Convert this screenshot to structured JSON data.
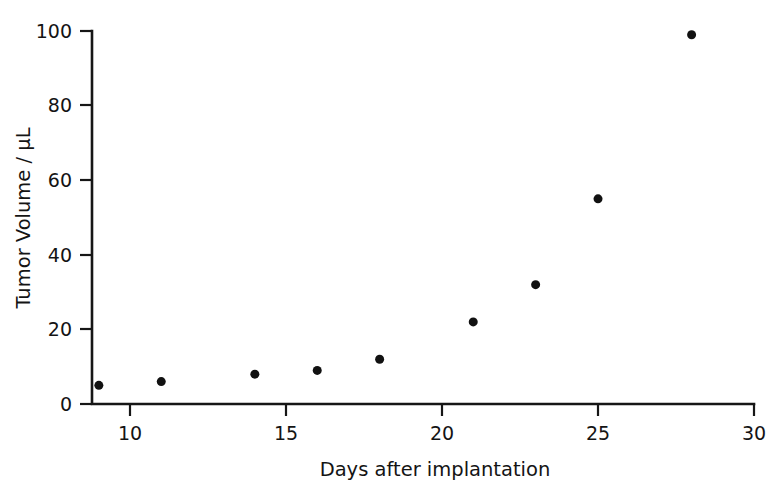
{
  "chart_data": {
    "type": "scatter",
    "title": "",
    "xlabel": "Days after implantation",
    "ylabel": "Tumor Volume / µL",
    "xlim": [
      8.78,
      30
    ],
    "ylim": [
      0,
      100
    ],
    "xticks": [
      10,
      15,
      20,
      25,
      30
    ],
    "xtick_labels": [
      "10",
      "15",
      "20",
      "25",
      "30"
    ],
    "yticks": [
      0,
      20,
      40,
      60,
      80,
      100
    ],
    "ytick_labels": [
      "0",
      "20",
      "40",
      "60",
      "80",
      "100"
    ],
    "grid": false,
    "legend": false,
    "marker": "filled-circle",
    "marker_color": "#111111",
    "marker_size_px": 9,
    "axis_color": "#161616",
    "background_color": "#ffffff",
    "x": [
      9,
      11,
      14,
      16,
      18,
      21,
      23,
      25,
      28
    ],
    "values": [
      5,
      6,
      8,
      9,
      12,
      22,
      32,
      55,
      99
    ],
    "points": [
      {
        "x": 9,
        "y": 5
      },
      {
        "x": 11,
        "y": 6
      },
      {
        "x": 14,
        "y": 8
      },
      {
        "x": 16,
        "y": 9
      },
      {
        "x": 18,
        "y": 12
      },
      {
        "x": 21,
        "y": 22
      },
      {
        "x": 23,
        "y": 32
      },
      {
        "x": 25,
        "y": 55
      },
      {
        "x": 28,
        "y": 99
      }
    ]
  },
  "axes": {
    "y_title": "Tumor Volume / µL",
    "x_title": "Days after implantation",
    "y_labels": [
      "100",
      "80",
      "60",
      "40",
      "20",
      "0"
    ],
    "x_labels": [
      "10",
      "15",
      "20",
      "25",
      "30"
    ]
  }
}
